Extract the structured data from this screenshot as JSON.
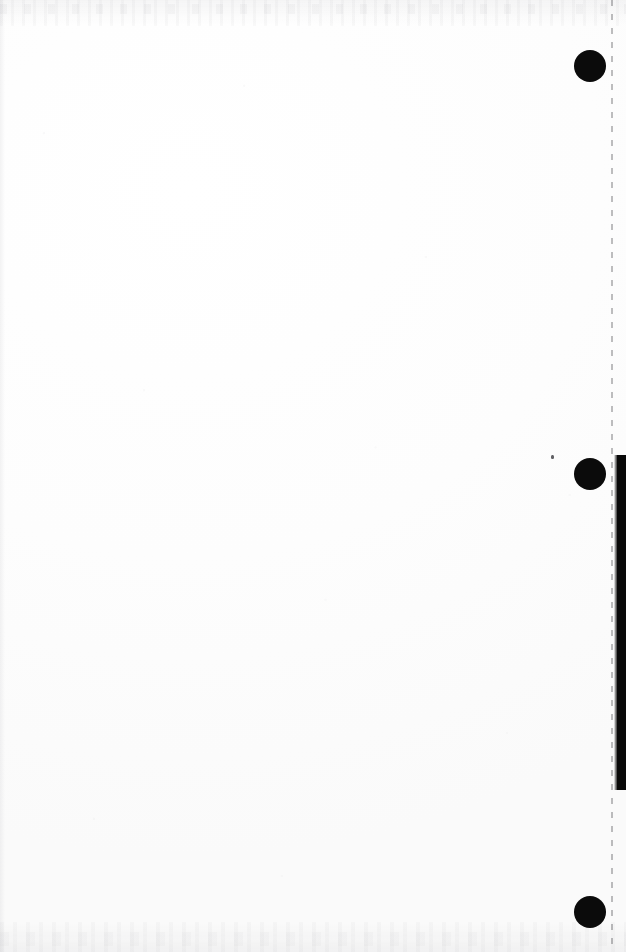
{
  "document": {
    "page_label": "",
    "content_text": "",
    "background_color": "#fefefe",
    "ink_color": "#0b0b0b",
    "width_px": 626,
    "height_px": 952
  },
  "marks": {
    "registration_dots": [
      {
        "name": "registration-dot-top",
        "center_x": 590,
        "center_y": 66,
        "diameter": 32
      },
      {
        "name": "registration-dot-middle",
        "center_x": 590,
        "center_y": 474,
        "diameter": 32
      },
      {
        "name": "registration-dot-bottom",
        "center_x": 590,
        "center_y": 912,
        "diameter": 32
      }
    ],
    "dashed_guide": {
      "x": 611,
      "top": 0,
      "height": 952,
      "color": "#282a2d"
    },
    "edge_bar": {
      "x": 617,
      "top": 455,
      "width": 9,
      "height": 335,
      "color": "#080808"
    },
    "stray_speck": {
      "x": 551,
      "y": 455,
      "width": 3,
      "height": 4
    }
  },
  "scan_artifacts": {
    "top_noise_label": "top-edge-scan-noise",
    "bottom_noise_label": "bottom-edge-scan-noise",
    "left_shadow_label": "left-edge-scan-shadow",
    "speckle_label": "paper-speckle"
  }
}
